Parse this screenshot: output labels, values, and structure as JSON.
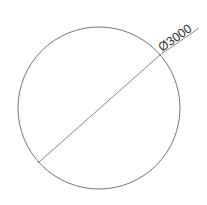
{
  "drawing": {
    "type": "diameter-dimension",
    "dimension_label": "Ø3000",
    "circle": {
      "cx": 99,
      "cy": 108,
      "r": 81
    },
    "dimension_line": {
      "x1": 38,
      "y1": 163,
      "x2": 160,
      "y2": 55
    },
    "leader": {
      "x1": 160,
      "y1": 55,
      "x2": 199,
      "y2": 28
    },
    "stroke_color": "#777777",
    "text_color": "#333333"
  }
}
